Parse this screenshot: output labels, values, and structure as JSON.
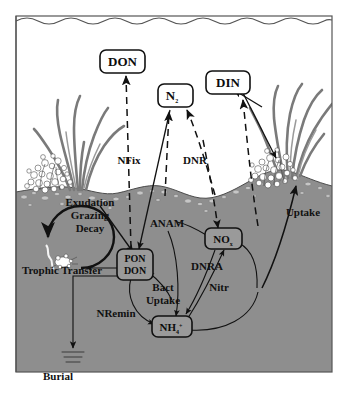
{
  "figure": {
    "background_color": "#ffffff",
    "water_column_color": "#ffffff",
    "sediment_color": "#8e8e8e",
    "outline_color": "#555555",
    "ink_color": "#111111"
  },
  "pools": [
    {
      "id": "don_water",
      "label": "DON",
      "x": 122,
      "y": 62
    },
    {
      "id": "n2",
      "label": "N",
      "sub": "2",
      "x": 175,
      "y": 95
    },
    {
      "id": "din",
      "label": "DIN",
      "x": 229,
      "y": 83
    },
    {
      "id": "pon_don",
      "label_line1": "PON",
      "label_line2": "DON",
      "x": 135,
      "y": 262
    },
    {
      "id": "nox",
      "label": "NO",
      "sub": "x",
      "x": 222,
      "y": 239
    },
    {
      "id": "nh4",
      "label": "NH",
      "sub": "4",
      "sup": "+",
      "x": 172,
      "y": 328
    }
  ],
  "process_labels": [
    {
      "id": "nfix",
      "text": "NFix",
      "x": 129,
      "y": 160
    },
    {
      "id": "dnr",
      "text": "DNR",
      "x": 193,
      "y": 160
    },
    {
      "id": "exudation",
      "text": "Exudation",
      "x": 92,
      "y": 203
    },
    {
      "id": "grazing",
      "text": "Grazing",
      "x": 92,
      "y": 216
    },
    {
      "id": "decay",
      "text": "Decay",
      "x": 92,
      "y": 229
    },
    {
      "id": "anam",
      "text": "ANAM",
      "x": 167,
      "y": 224
    },
    {
      "id": "uptake_right",
      "text": "Uptake",
      "x": 304,
      "y": 213
    },
    {
      "id": "dnra",
      "text": "DNRA",
      "x": 206,
      "y": 267
    },
    {
      "id": "nitr",
      "text": "Nitr",
      "x": 218,
      "y": 288
    },
    {
      "id": "trophic",
      "text": "Trophic Transfer",
      "x": 62,
      "y": 271
    },
    {
      "id": "bact",
      "text": "Bact",
      "x": 163,
      "y": 288
    },
    {
      "id": "bactuptake",
      "text": "Uptake",
      "x": 163,
      "y": 301
    },
    {
      "id": "nremin",
      "text": "NRemin",
      "x": 116,
      "y": 314
    },
    {
      "id": "burial",
      "text": "Burial",
      "x": 58,
      "y": 377
    }
  ],
  "scene_elements": [
    {
      "id": "water-surface",
      "name": "wavy water surface line"
    },
    {
      "id": "seafloor",
      "name": "undulating sediment surface"
    },
    {
      "id": "seagrass-left",
      "name": "seagrass blades left"
    },
    {
      "id": "seagrass-right",
      "name": "seagrass blades right"
    },
    {
      "id": "algae-left",
      "name": "algal / coral cluster left"
    },
    {
      "id": "algae-right",
      "name": "algal / coral cluster right"
    },
    {
      "id": "benthic-fauna",
      "name": "worm and invertebrate in trophic circle"
    },
    {
      "id": "burial-lines",
      "name": "burial stratification lines"
    }
  ],
  "flow_types": {
    "solid": "solid arrow (direct transformation / uptake flux)",
    "dashed": "dashed arrow (gas or dissolved exchange flux)"
  }
}
